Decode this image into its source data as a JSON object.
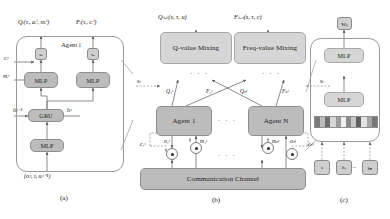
{
  "figure": {
    "panel_labels": {
      "a": "(a)",
      "b": "(b)",
      "c": "(c)"
    },
    "ellipsis": "· · ·"
  },
  "colors": {
    "module_fill": "#bcbcbc",
    "module_stroke": "#8e8e8e",
    "chip_fill": "#cfcfcf",
    "container_stroke": "#9a9a9a",
    "wire": "#6f6f6f",
    "dashed_wire": "#9b9b9b",
    "background": "#ffffff"
  },
  "panel_a": {
    "name": "Agent network internals",
    "container_label": "Agent i",
    "outputs": [
      {
        "id": "q-head",
        "label": "Qᵢ(τᵢ, aᵢᵗ, mᵢᵗ)"
      },
      {
        "id": "f-head",
        "label": "Fᵢ(τᵢ, cᵢᵗ)"
      }
    ],
    "gates": [
      {
        "id": "softmax-left",
        "label": "sₐ"
      },
      {
        "id": "softmax-right",
        "label": "sₐ"
      }
    ],
    "modules": [
      {
        "id": "mlp-q",
        "label": "MLP"
      },
      {
        "id": "mlp-f",
        "label": "MLP"
      },
      {
        "id": "gru",
        "label": "GRU"
      },
      {
        "id": "mlp-enc",
        "label": "MLP"
      }
    ],
    "side_labels": [
      {
        "id": "c-in",
        "label": "cᵢᵗ"
      },
      {
        "id": "m-in",
        "label": "mᵢᵗ"
      },
      {
        "id": "h-prev",
        "label": "hᵢᵗ⁻¹"
      },
      {
        "id": "h-next",
        "label": "hᵢᵗ"
      }
    ],
    "input": "(oᵢᵗ, i, uᵢᵗ⁻¹)"
  },
  "panel_b": {
    "name": "Mixing networks and communication",
    "outputs": [
      {
        "id": "q-tot",
        "label": "Qₜₒₜ(s, τ, u)"
      },
      {
        "id": "f-tot",
        "label": "Fₜₒₜ(s, τ, c)"
      }
    ],
    "mixers": [
      {
        "id": "q-mixing",
        "label": "Q-value Mixing"
      },
      {
        "id": "f-mixing",
        "label": "Freq-value Mixing"
      }
    ],
    "state_inputs": [
      {
        "id": "state-left",
        "label": "sₜ"
      },
      {
        "id": "state-right",
        "label": "sₜ"
      }
    ],
    "agents": [
      {
        "id": "agent-1",
        "label": "Agent 1",
        "q_label": "Q₁ᵗ",
        "f_label": "F₁ᵗ",
        "msg_label": "m₁ᵗ",
        "code_label": "c₁ᵗ",
        "obs_label": "o₁ᵗ"
      },
      {
        "id": "agent-n",
        "label": "Agent N",
        "q_label": "Qₙᵗ",
        "f_label": "Fₙᵗ",
        "msg_label": "mₙᵗ",
        "code_label": "cₙᵗ",
        "obs_label": "oₙᵗ"
      }
    ],
    "channel": {
      "id": "communication-channel",
      "label": "Communication Channel"
    }
  },
  "panel_c": {
    "name": "Mixing network hypernetwork detail",
    "output_chip": "Wₖ",
    "modules": [
      {
        "id": "mlp-top",
        "label": "MLP"
      },
      {
        "id": "mlp-bottom",
        "label": "MLP"
      }
    ],
    "feature_strip": {
      "id": "embedding-strip",
      "segments": [
        "#7a7a7a",
        "#bdbdbd",
        "#6e6e6e",
        "#d8d8d8",
        "#9c9c9c",
        "#efefef",
        "#8a8a8a",
        "#c6c6c6",
        "#5f5f5f",
        "#e3e3e3",
        "#a4a4a4",
        "#767676"
      ]
    },
    "inputs": [
      {
        "id": "state-chip",
        "label": "s"
      },
      {
        "id": "h1-chip",
        "label": "h₁"
      },
      {
        "id": "hn-chip",
        "label": "hₙ"
      }
    ]
  }
}
